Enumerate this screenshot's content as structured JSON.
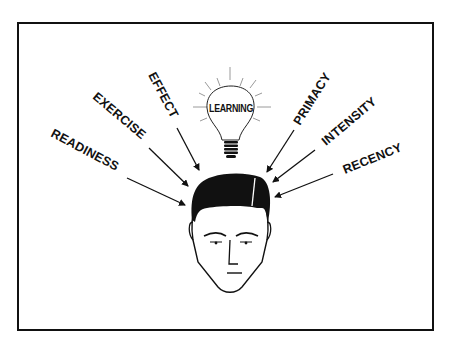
{
  "diagram": {
    "center_label": "LEARNING",
    "left_labels": [
      {
        "text": "READINESS"
      },
      {
        "text": "EXERCISE"
      },
      {
        "text": "EFFECT"
      }
    ],
    "right_labels": [
      {
        "text": "PRIMACY"
      },
      {
        "text": "INTENSITY"
      },
      {
        "text": "RECENCY"
      }
    ],
    "colors": {
      "ink": "#111111",
      "background": "#ffffff",
      "bulb_rays": "#9a9a9a"
    }
  }
}
